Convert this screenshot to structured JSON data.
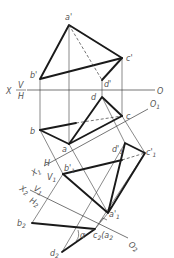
{
  "figure": {
    "colors": {
      "line": "#1a1a1a",
      "thin": "#3a3a3a",
      "label": "#555555",
      "background": "#ffffff"
    }
  },
  "axes": {
    "x": {
      "left_label": "X",
      "right_label": "O",
      "upper_plane": "V",
      "lower_plane": "H"
    },
    "x1": {
      "left_label": "X",
      "left_sub": "1",
      "right_label": "O",
      "right_sub": "1",
      "upper_plane": "H",
      "lower_plane": "V",
      "lower_sub": "1"
    },
    "x2": {
      "left_label": "X",
      "left_sub": "2",
      "right_label": "O",
      "right_sub": "2",
      "upper_plane": "V",
      "upper_sub": "1",
      "lower_plane": "H",
      "lower_sub": "2"
    }
  },
  "points": {
    "front": {
      "a": {
        "label": "a'",
        "x": 69,
        "y": 25
      },
      "b": {
        "label": "b'",
        "x": 40,
        "y": 79
      },
      "c": {
        "label": "c'",
        "x": 122,
        "y": 58
      },
      "d": {
        "label": "d'",
        "x": 102,
        "y": 80
      }
    },
    "top": {
      "a": {
        "label": "a",
        "x": 69,
        "y": 144
      },
      "b": {
        "label": "b",
        "x": 40,
        "y": 130
      },
      "c": {
        "label": "c",
        "x": 122,
        "y": 116
      },
      "d": {
        "label": "d",
        "x": 102,
        "y": 97
      }
    },
    "v1": {
      "a": {
        "label": "a'",
        "sub": "1",
        "x": 108,
        "y": 213
      },
      "b": {
        "label": "b'",
        "sub": "1",
        "x": 63,
        "y": 174
      },
      "c": {
        "label": "c'",
        "sub": "1",
        "x": 145,
        "y": 153
      },
      "d": {
        "label": "d'",
        "sub": "1",
        "x": 125,
        "y": 143
      }
    },
    "h2": {
      "b": {
        "label": "b",
        "sub": "2",
        "x": 32,
        "y": 223
      },
      "c": {
        "label": "c",
        "sub": "2",
        "extra": "(a",
        "extra_sub": "2",
        "extra_close": ")",
        "x": 95,
        "y": 229
      },
      "d": {
        "label": "d",
        "sub": "2",
        "x": 62,
        "y": 252
      }
    }
  },
  "annotations": {
    "angle": "α"
  }
}
